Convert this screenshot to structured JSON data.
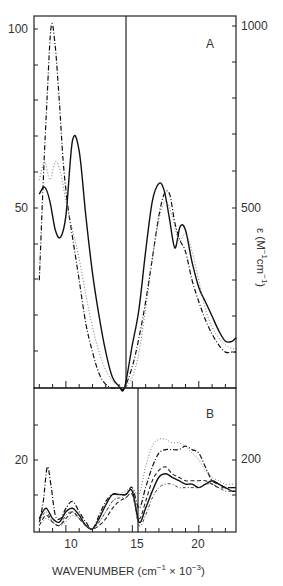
{
  "chart_data": [
    {
      "panel": "A",
      "type": "line",
      "title": "",
      "panel_label": "A",
      "xlabel": "WAVENUMBER (cm⁻¹ × 10⁻³)",
      "ylabel_left": "",
      "ylabel_right": "ε (M⁻¹cm⁻¹)",
      "xlim": [
        7.6,
        22.8
      ],
      "ylim_left": [
        0,
        103
      ],
      "ylim_right": [
        0,
        1030
      ],
      "left_ticks": [
        {
          "value": 100,
          "label": "100"
        },
        {
          "value": 50,
          "label": "50"
        }
      ],
      "right_ticks": [
        {
          "value": 1000,
          "label": "1000"
        },
        {
          "value": 500,
          "label": "500"
        }
      ],
      "x_ticks": [
        {
          "value": 10,
          "label": "10"
        },
        {
          "value": 15,
          "label": "15"
        },
        {
          "value": 20,
          "label": "20"
        }
      ],
      "divider_x": 14.4,
      "note": "Left of divider read on left axis (x10 scale); right of divider read on right axis",
      "series": [
        {
          "name": "solid",
          "style": "solid",
          "x": [
            8.0,
            8.4,
            8.8,
            9.2,
            9.6,
            10.0,
            10.5,
            11.0,
            11.5,
            12.0,
            12.5,
            13.0,
            13.5,
            14.0,
            14.4,
            15.0,
            15.5,
            16.0,
            16.5,
            17.0,
            17.4,
            17.8,
            18.2,
            18.6,
            19.0,
            19.5,
            20.0,
            20.5,
            21.0,
            21.5,
            22.0,
            22.5,
            22.8
          ],
          "y": [
            54,
            56,
            52,
            44,
            42,
            48,
            69,
            66,
            48,
            32,
            20,
            10,
            3,
            0.5,
            0,
            12,
            22,
            38,
            52,
            57,
            55,
            47,
            39,
            45,
            44,
            35,
            28,
            24,
            20,
            16,
            13,
            13,
            14
          ]
        },
        {
          "name": "dash-dot",
          "style": "dashdot",
          "x": [
            8.0,
            8.3,
            8.6,
            8.9,
            9.2,
            9.5,
            9.8,
            10.1,
            10.5,
            11.0,
            11.5,
            12.0,
            12.5,
            13.0,
            13.5,
            14.0,
            14.4,
            15.0,
            15.5,
            16.0,
            16.5,
            17.0,
            17.4,
            17.8,
            18.2,
            18.6,
            19.0,
            19.5,
            20.0,
            20.5,
            21.0,
            21.5,
            22.0,
            22.5,
            22.8
          ],
          "y": [
            30,
            58,
            82,
            101,
            95,
            80,
            63,
            52,
            42,
            30,
            18,
            10,
            4,
            1,
            0,
            0,
            0,
            6,
            14,
            24,
            36,
            48,
            54,
            54,
            46,
            41,
            38,
            30,
            24,
            19,
            15,
            12,
            10,
            10,
            10
          ]
        },
        {
          "name": "dotted",
          "style": "dotted",
          "x": [
            8.0,
            8.4,
            8.8,
            9.2,
            9.6,
            10.0,
            10.5,
            11.0,
            11.5,
            12.0,
            12.5,
            13.0,
            13.5,
            14.0,
            14.4,
            15.0,
            15.5,
            16.0,
            16.5,
            17.0,
            17.5,
            18.0,
            18.5,
            19.0,
            19.5,
            20.0,
            20.5,
            21.0,
            21.5,
            22.0,
            22.5,
            22.8
          ],
          "y": [
            58,
            63,
            58,
            63,
            60,
            52,
            44,
            36,
            26,
            17,
            10,
            5,
            2,
            0.5,
            0,
            3,
            10,
            22,
            36,
            47,
            52,
            48,
            41,
            43,
            38,
            30,
            22,
            17,
            14,
            12,
            11,
            11
          ]
        }
      ]
    },
    {
      "panel": "B",
      "type": "line",
      "panel_label": "B",
      "xlim": [
        7.6,
        22.8
      ],
      "left_ticks": [
        {
          "value": 20,
          "label": "20"
        }
      ],
      "right_ticks": [
        {
          "value": 200,
          "label": "200"
        }
      ],
      "x_ticks": [
        {
          "value": 10,
          "label": "10"
        },
        {
          "value": 15,
          "label": "15"
        },
        {
          "value": 20,
          "label": "20"
        }
      ],
      "divider_x": 15.0,
      "series": [
        {
          "name": "solid",
          "style": "solid",
          "x": [
            8.0,
            8.5,
            9.0,
            9.5,
            10.0,
            10.5,
            11.0,
            11.5,
            12.0,
            12.5,
            13.0,
            13.5,
            14.0,
            14.5,
            15.0,
            15.5,
            16.0,
            16.5,
            17.0,
            17.5,
            18.0,
            18.5,
            19.0,
            19.5,
            20.0,
            20.5,
            21.0,
            21.5,
            22.0,
            22.5,
            22.8
          ],
          "y": [
            3,
            6,
            3,
            2,
            5,
            6,
            4,
            1,
            0,
            3,
            7,
            10,
            10,
            10,
            11,
            2,
            6,
            11,
            15,
            16,
            15,
            14,
            13,
            13,
            12,
            13,
            14,
            13,
            12,
            11,
            11
          ]
        },
        {
          "name": "dash-dot",
          "style": "dashdot",
          "x": [
            8.0,
            8.3,
            8.6,
            8.9,
            9.2,
            9.6,
            10.0,
            10.5,
            11.0,
            11.5,
            12.0,
            12.5,
            13.0,
            13.5,
            14.0,
            14.5,
            15.0,
            15.5,
            16.0,
            16.5,
            17.0,
            17.5,
            18.0,
            18.5,
            19.0,
            19.5,
            20.0,
            20.5,
            21.0,
            21.5,
            22.0,
            22.5,
            22.8
          ],
          "y": [
            2,
            8,
            18,
            12,
            4,
            3,
            6,
            8,
            5,
            2,
            0,
            4,
            8,
            10,
            10,
            10,
            12,
            6,
            12,
            18,
            22,
            23,
            23,
            23,
            24,
            23,
            22,
            18,
            14,
            13,
            12,
            12,
            12
          ]
        },
        {
          "name": "dashed",
          "style": "dashed",
          "x": [
            8.0,
            8.5,
            9.0,
            9.5,
            10.0,
            10.5,
            11.0,
            11.5,
            12.0,
            12.5,
            13.0,
            13.5,
            14.0,
            14.5,
            15.0,
            15.5,
            16.0,
            16.5,
            17.0,
            17.5,
            18.0,
            18.5,
            19.0,
            19.5,
            20.0,
            20.5,
            21.0,
            21.5,
            22.0,
            22.5,
            22.8
          ],
          "y": [
            1,
            4,
            2,
            1,
            3,
            5,
            3,
            1,
            0,
            1,
            3,
            6,
            8,
            9,
            10,
            3,
            8,
            14,
            17,
            18,
            16,
            15,
            14,
            14,
            14,
            14,
            13,
            12,
            12,
            12,
            12
          ]
        },
        {
          "name": "dotted",
          "style": "dotted",
          "x": [
            8.0,
            8.5,
            9.0,
            9.5,
            10.0,
            10.5,
            11.0,
            11.5,
            12.0,
            12.5,
            13.0,
            13.5,
            14.0,
            14.5,
            15.0,
            15.5,
            16.0,
            16.5,
            17.0,
            17.5,
            18.0,
            18.5,
            19.0,
            19.5,
            20.0,
            20.5,
            21.0,
            21.5,
            22.0,
            22.5,
            22.8
          ],
          "y": [
            1,
            3,
            2,
            1,
            2,
            4,
            3,
            1,
            0,
            2,
            5,
            8,
            10,
            11,
            12,
            10,
            18,
            24,
            26,
            26,
            25,
            25,
            24,
            22,
            20,
            17,
            15,
            14,
            13,
            13,
            13
          ]
        },
        {
          "name": "dash-dot-2",
          "style": "dashdot2",
          "x": [
            8.0,
            8.5,
            9.0,
            9.5,
            10.0,
            10.5,
            11.0,
            11.5,
            12.0,
            12.5,
            13.0,
            13.5,
            14.0,
            14.5,
            15.0,
            15.5,
            16.0,
            16.5,
            17.0,
            17.5,
            18.0,
            18.5,
            19.0,
            19.5,
            20.0,
            20.5,
            21.0,
            21.5,
            22.0,
            22.5,
            22.8
          ],
          "y": [
            2,
            5,
            2,
            1,
            4,
            5,
            3,
            1,
            0,
            2,
            5,
            8,
            9,
            9,
            10,
            1,
            4,
            9,
            12,
            13,
            13,
            12,
            12,
            12,
            12,
            13,
            13,
            12,
            11,
            11,
            11
          ]
        }
      ]
    }
  ],
  "labels": {
    "panel_a": "A",
    "panel_b": "B",
    "a_left_100": "100",
    "a_left_50": "50",
    "a_right_1000": "1000",
    "a_right_500": "500",
    "b_left_20": "20",
    "b_right_200": "200",
    "x_10": "10",
    "x_15": "15",
    "x_20": "20",
    "xlabel_main": "WAVENUMBER (cm",
    "xlabel_sup1": "−1",
    "xlabel_mid": " × 10",
    "xlabel_sup2": "−3",
    "xlabel_end": ")",
    "ylabel_eps": "ε (M",
    "ylabel_sup1": "−1",
    "ylabel_cm": "cm",
    "ylabel_sup2": "−1",
    "ylabel_end": ")"
  }
}
